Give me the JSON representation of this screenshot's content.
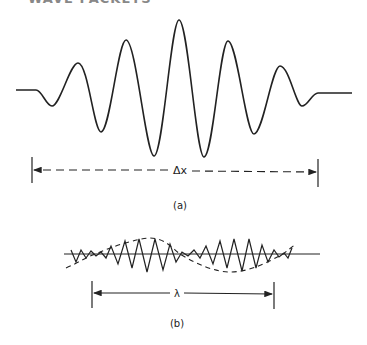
{
  "header_fragment": "WAVE PACKETS",
  "panel_a": {
    "caption": "(a)",
    "width_label": "Δx",
    "description": "Wave packet with Gaussian-like envelope, 5 peaks"
  },
  "panel_b": {
    "caption": "(b)",
    "width_label": "λ",
    "description": "Beat pattern: rapid oscillation modulated by dashed sinusoidal envelope"
  },
  "colors": {
    "ink": "#222222",
    "background": "#ffffff"
  }
}
